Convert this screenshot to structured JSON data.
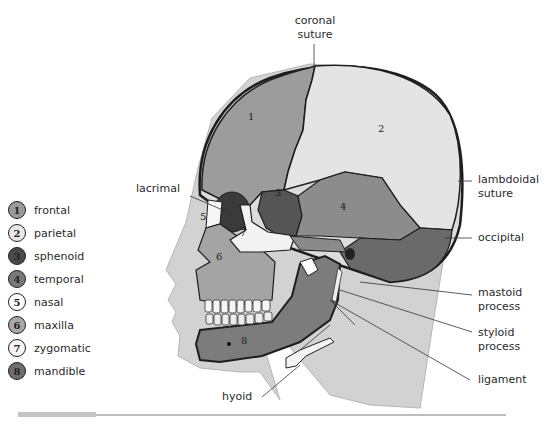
{
  "legend": {
    "items": [
      {
        "number": "1",
        "label": "frontal",
        "fill": "#9a9a9a",
        "text": "#222"
      },
      {
        "number": "2",
        "label": "parietal",
        "fill": "#e8e8e8",
        "text": "#222"
      },
      {
        "number": "3",
        "label": "sphenoid",
        "fill": "#4a4a4a",
        "text": "#222"
      },
      {
        "number": "4",
        "label": "temporal",
        "fill": "#7a7a7a",
        "text": "#222"
      },
      {
        "number": "5",
        "label": "nasal",
        "fill": "#ffffff",
        "text": "#222"
      },
      {
        "number": "6",
        "label": "maxilla",
        "fill": "#a8a8a8",
        "text": "#222"
      },
      {
        "number": "7",
        "label": "zygomatic",
        "fill": "#f4f4f4",
        "text": "#222"
      },
      {
        "number": "8",
        "label": "mandible",
        "fill": "#6e6e6e",
        "text": "#222"
      }
    ]
  },
  "annotations": {
    "coronal_suture": {
      "line1": "coronal",
      "line2": "suture"
    },
    "lambdoidal_suture": {
      "line1": "lambdoidal",
      "line2": "suture"
    },
    "occipital": "occipital",
    "mastoid_process": {
      "line1": "mastoid",
      "line2": "process"
    },
    "styloid_process": {
      "line1": "styloid",
      "line2": "process"
    },
    "ligament": "ligament",
    "hyoid": "hyoid",
    "lacrimal": "lacrimal"
  },
  "bone_numbers": {
    "frontal": "1",
    "parietal": "2",
    "sphenoid": "3",
    "temporal": "4",
    "nasal": "5",
    "maxilla": "6",
    "zygomatic": "7",
    "mandible": "8"
  },
  "colors": {
    "frontal": "#9c9c9c",
    "parietal": "#dedede",
    "sphenoid": "#555555",
    "temporal": "#8a8a8a",
    "maxilla": "#a0a0a0",
    "mandible": "#7a7a7a",
    "zygomatic": "#f2f2f2",
    "skin": "#cfcfcf",
    "outline": "#1e1e1e"
  }
}
